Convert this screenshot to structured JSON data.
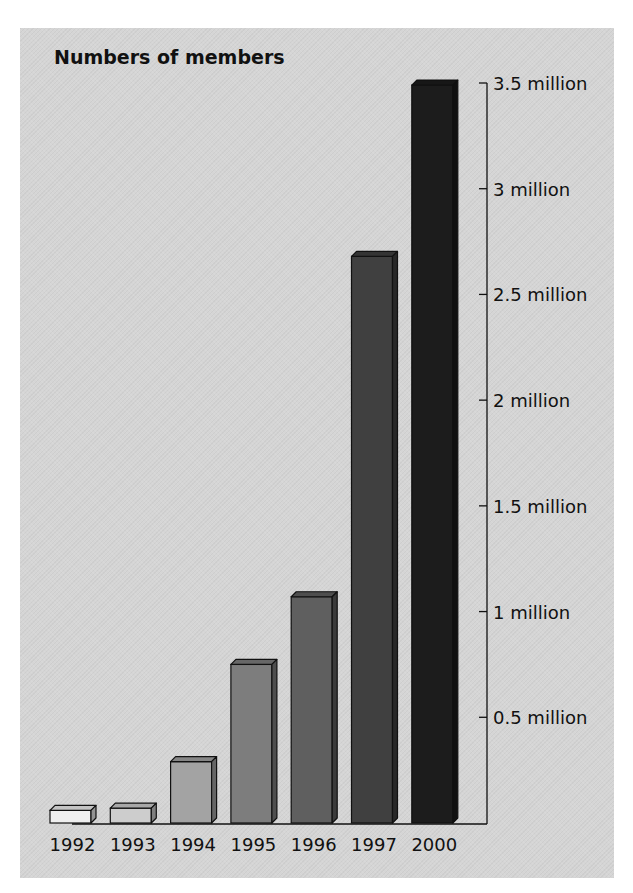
{
  "chart_data": {
    "type": "bar",
    "title": "Numbers of members",
    "xlabel": "",
    "ylabel": "",
    "categories": [
      "1992",
      "1993",
      "1994",
      "1995",
      "1996",
      "1997",
      "2000"
    ],
    "values": [
      0.06,
      0.07,
      0.29,
      0.75,
      1.07,
      2.68,
      3.49
    ],
    "unit": "million",
    "ylim": [
      0,
      3.5
    ],
    "yticks": [
      0.5,
      1,
      1.5,
      2,
      2.5,
      3,
      3.5
    ],
    "ytick_labels": [
      "0.5 million",
      "1 million",
      "1.5 million",
      "2 million",
      "2.5 million",
      "3 million",
      "3.5 million"
    ],
    "y_axis_position": "right",
    "grid": false,
    "legend": null,
    "style": "3d-bars",
    "bar_colors": [
      "#efefef",
      "#cdcdcd",
      "#a3a3a3",
      "#7d7d7d",
      "#5f5f5f",
      "#404040",
      "#1c1c1c"
    ]
  }
}
